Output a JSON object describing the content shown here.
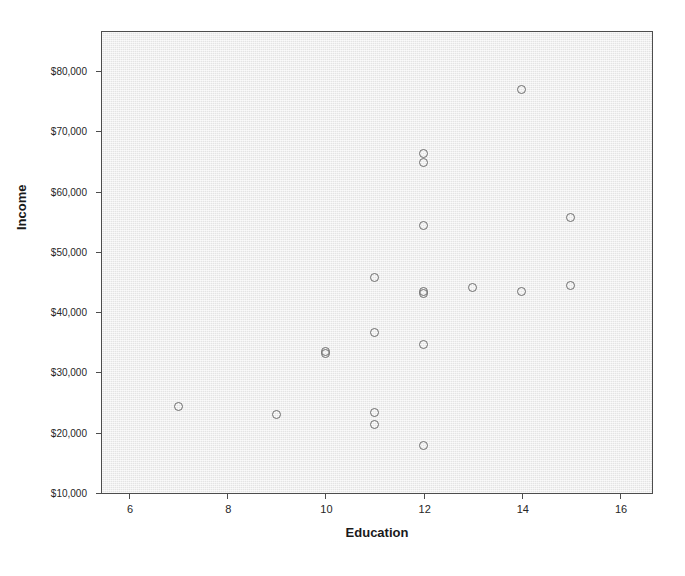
{
  "chart_data": {
    "type": "scatter",
    "title": "",
    "xlabel": "Education",
    "ylabel": "Income",
    "xlim": [
      5.45,
      16.65
    ],
    "ylim": [
      10000,
      86500
    ],
    "grid": false,
    "legend": null,
    "marker_style": "open-circle",
    "x_ticks": [
      6,
      8,
      10,
      12,
      14,
      16
    ],
    "x_tick_labels": [
      "6",
      "8",
      "10",
      "12",
      "14",
      "16"
    ],
    "y_ticks": [
      10000,
      20000,
      30000,
      40000,
      50000,
      60000,
      70000,
      80000
    ],
    "y_tick_labels": [
      "$10,000",
      "$20,000",
      "$30,000",
      "$40,000",
      "$50,000",
      "$60,000",
      "$70,000",
      "$80,000"
    ],
    "points": [
      {
        "x": 7,
        "y": 24300
      },
      {
        "x": 9,
        "y": 23100
      },
      {
        "x": 10,
        "y": 33500
      },
      {
        "x": 10,
        "y": 33100
      },
      {
        "x": 11,
        "y": 45700
      },
      {
        "x": 11,
        "y": 36600
      },
      {
        "x": 11,
        "y": 23300
      },
      {
        "x": 11,
        "y": 21300
      },
      {
        "x": 12,
        "y": 66400
      },
      {
        "x": 12,
        "y": 64900
      },
      {
        "x": 12,
        "y": 54400
      },
      {
        "x": 12,
        "y": 43500
      },
      {
        "x": 12,
        "y": 43100
      },
      {
        "x": 12,
        "y": 34700
      },
      {
        "x": 12,
        "y": 17800
      },
      {
        "x": 13,
        "y": 44100
      },
      {
        "x": 14,
        "y": 76900
      },
      {
        "x": 14,
        "y": 43500
      },
      {
        "x": 15,
        "y": 55700
      },
      {
        "x": 15,
        "y": 44500
      }
    ]
  },
  "colors": {
    "plot_background": "#ebebeb",
    "frame": "#4d4d4d",
    "marker_stroke": "#6e6e6e",
    "text": "#1a1a1a",
    "page_background": "#ffffff"
  }
}
